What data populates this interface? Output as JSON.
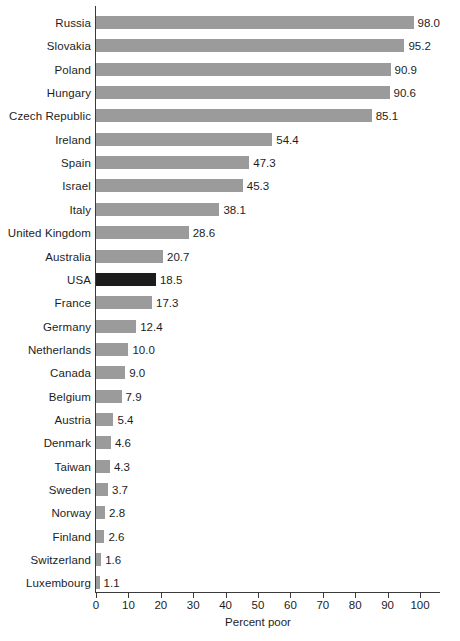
{
  "chart_data": {
    "type": "bar",
    "orientation": "horizontal",
    "title": "",
    "xlabel": "Percent poor",
    "ylabel": "",
    "xlim": [
      0,
      100
    ],
    "xticks": [
      0,
      10,
      20,
      30,
      40,
      50,
      60,
      70,
      80,
      90,
      100
    ],
    "grid": false,
    "legend": "none",
    "bar_color": "#9b9b9b",
    "highlight_color": "#1c1c1c",
    "highlighted_category": "USA",
    "categories": [
      "Russia",
      "Slovakia",
      "Poland",
      "Hungary",
      "Czech Republic",
      "Ireland",
      "Spain",
      "Israel",
      "Italy",
      "United Kingdom",
      "Australia",
      "USA",
      "France",
      "Germany",
      "Netherlands",
      "Canada",
      "Belgium",
      "Austria",
      "Denmark",
      "Taiwan",
      "Sweden",
      "Norway",
      "Finland",
      "Switzerland",
      "Luxembourg"
    ],
    "values": [
      98.0,
      95.2,
      90.9,
      90.6,
      85.1,
      54.4,
      47.3,
      45.3,
      38.1,
      28.6,
      20.7,
      18.5,
      17.3,
      12.4,
      10.0,
      9.0,
      7.9,
      5.4,
      4.6,
      4.3,
      3.7,
      2.8,
      2.6,
      1.6,
      1.1
    ],
    "value_labels": [
      "98.0",
      "95.2",
      "90.9",
      "90.6",
      "85.1",
      "54.4",
      "47.3",
      "45.3",
      "38.1",
      "28.6",
      "20.7",
      "18.5",
      "17.3",
      "12.4",
      "10.0",
      "9.0",
      "7.9",
      "5.4",
      "4.6",
      "4.3",
      "3.7",
      "2.8",
      "2.6",
      "1.6",
      "1.1"
    ],
    "xtick_labels": [
      "0",
      "10",
      "20",
      "30",
      "40",
      "50",
      "60",
      "70",
      "80",
      "90",
      "100"
    ]
  }
}
